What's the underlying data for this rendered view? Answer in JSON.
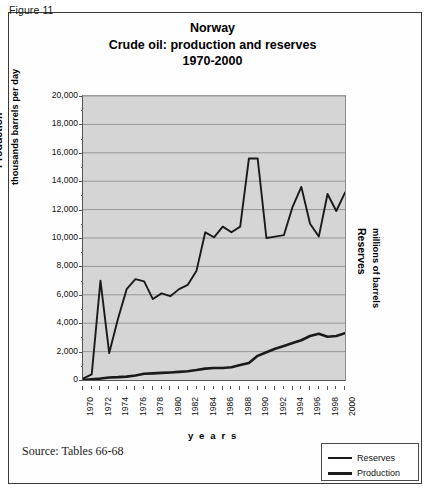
{
  "figure": {
    "label": "Figure 11"
  },
  "title": {
    "line1": "Norway",
    "line2": "Crude oil: production and reserves",
    "line3": "1970-2000"
  },
  "axes": {
    "left_title": "Production",
    "left_subtitle": "thousands barrels per day",
    "right_title": "Reserves",
    "right_subtitle": "millions of barrels",
    "x_title": "y e a r s"
  },
  "legend": {
    "items": [
      {
        "label": "Reserves",
        "color": "#1a1a1a",
        "thickness": 2
      },
      {
        "label": "Production",
        "color": "#1a1a1a",
        "thickness": 3
      }
    ]
  },
  "source": {
    "text": "Source: Tables 66-68"
  },
  "colors": {
    "plot_background": "#d5d5d5",
    "gridline": "#8f8f8f",
    "axis": "#555555",
    "line": "#1a1a1a",
    "frame": "#3a3a3a"
  },
  "chart_data": {
    "type": "line",
    "xlabel": "years",
    "ylabel": "Production thousands barrels per day",
    "y2label": "Reserves millions of barrels",
    "xlim": [
      1970,
      2000
    ],
    "ylim": [
      0,
      20000
    ],
    "ytick_step": 2000,
    "grid": true,
    "legend_position": "bottom-right",
    "ytick_labels": [
      "0",
      "2,000",
      "4,000",
      "6,000",
      "8,000",
      "10,000",
      "12,000",
      "14,000",
      "16,000",
      "18,000",
      "20,000"
    ],
    "xtick_labels": [
      "1970",
      "1972",
      "1974",
      "1976",
      "1978",
      "1980",
      "1982",
      "1984",
      "1986",
      "1988",
      "1990",
      "1992",
      "1994",
      "1996",
      "1998",
      "2000"
    ],
    "x": [
      1970,
      1971,
      1972,
      1973,
      1974,
      1975,
      1976,
      1977,
      1978,
      1979,
      1980,
      1981,
      1982,
      1983,
      1984,
      1985,
      1986,
      1987,
      1988,
      1989,
      1990,
      1991,
      1992,
      1993,
      1994,
      1995,
      1996,
      1997,
      1998,
      1999,
      2000
    ],
    "series": [
      {
        "name": "Reserves",
        "values": [
          100,
          400,
          7000,
          1900,
          4300,
          6400,
          7100,
          6950,
          5700,
          6100,
          5900,
          6400,
          6700,
          7700,
          10400,
          10050,
          10800,
          10400,
          10800,
          15600,
          15600,
          10000,
          10100,
          10200,
          12200,
          13600,
          11000,
          10100,
          13100,
          11900,
          13200
        ]
      },
      {
        "name": "Production",
        "values": [
          0,
          50,
          100,
          180,
          200,
          240,
          320,
          440,
          470,
          500,
          530,
          570,
          620,
          700,
          800,
          840,
          850,
          900,
          1050,
          1200,
          1700,
          1950,
          2200,
          2400,
          2600,
          2800,
          3100,
          3250,
          3050,
          3100,
          3300
        ]
      }
    ]
  }
}
